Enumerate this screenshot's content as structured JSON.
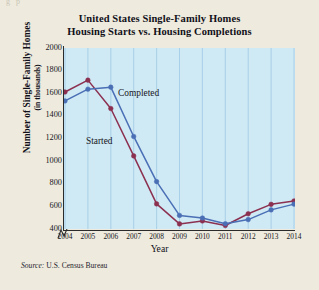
{
  "page": {
    "scrap_text": "g  p",
    "background_color": "#eeeade"
  },
  "title": {
    "line1": "United States Single-Family Homes",
    "line2": "Housing Starts vs. Housing Completions"
  },
  "axes": {
    "y_title_main": "Number of Single-Family Homes",
    "y_title_sub": "(in thousands)",
    "x_title": "Year"
  },
  "source": {
    "label": "Source:",
    "text": "U.S. Census Bureau"
  },
  "annotations": {
    "completed": "Completed",
    "started": "Started"
  },
  "colors": {
    "plot_background": "#cfe9f5",
    "gridline": "#9ec9e4",
    "axis": "#2b2b2b",
    "started_series": "#8c3050",
    "completed_series": "#4a6fb5"
  },
  "chart_data": {
    "type": "line",
    "title": "United States Single-Family Homes Housing Starts vs. Housing Completions",
    "xlabel": "Year",
    "ylabel": "Number of Single-Family Homes (in thousands)",
    "x": [
      2004,
      2005,
      2006,
      2007,
      2008,
      2009,
      2010,
      2011,
      2012,
      2013,
      2014
    ],
    "categories": [
      "2004",
      "2005",
      "2006",
      "2007",
      "2008",
      "2009",
      "2010",
      "2011",
      "2012",
      "2013",
      "2014"
    ],
    "xlim": [
      2004,
      2014
    ],
    "ylim": [
      400,
      2000
    ],
    "y_ticks": [
      400,
      600,
      800,
      1000,
      1200,
      1400,
      1600,
      1800,
      2000
    ],
    "y_axis_break": true,
    "grid": true,
    "grid_axis": "x",
    "legend": "inline-annotations",
    "series": [
      {
        "name": "Started",
        "color": "#8c3050",
        "values": [
          1611,
          1716,
          1465,
          1046,
          622,
          445,
          471,
          431,
          535,
          618,
          648
        ]
      },
      {
        "name": "Completed",
        "color": "#4a6fb5",
        "values": [
          1532,
          1636,
          1654,
          1218,
          819,
          520,
          497,
          447,
          483,
          569,
          620
        ]
      }
    ]
  }
}
